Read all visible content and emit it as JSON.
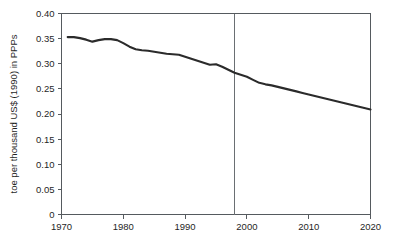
{
  "chart_data": {
    "type": "line",
    "title": "",
    "subtitle": "",
    "xlabel": "",
    "ylabel": "toe per thousand US$ (1990) in PPPs",
    "xlim": [
      1970,
      2020
    ],
    "ylim": [
      0,
      0.4
    ],
    "grid": false,
    "legend": "none",
    "x_ticks": [
      "1970",
      "1980",
      "1990",
      "2000",
      "2010",
      "2020"
    ],
    "x_tick_values": [
      1970,
      1980,
      1990,
      2000,
      2010,
      2020
    ],
    "y_ticks": [
      "0",
      "0.05",
      "0.10",
      "0.15",
      "0.20",
      "0.25",
      "0.30",
      "0.35",
      "0.40"
    ],
    "y_tick_values": [
      0,
      0.05,
      0.1,
      0.15,
      0.2,
      0.25,
      0.3,
      0.35,
      0.4
    ],
    "annotations": [
      {
        "name": "projection-divider",
        "type": "vertical-line",
        "x": 1998,
        "label": ""
      }
    ],
    "series": [
      {
        "name": "energy intensity",
        "x": [
          1971,
          1972,
          1973,
          1974,
          1975,
          1976,
          1977,
          1978,
          1979,
          1980,
          1981,
          1982,
          1983,
          1984,
          1985,
          1986,
          1987,
          1988,
          1989,
          1990,
          1991,
          1992,
          1993,
          1994,
          1995,
          1996,
          1997,
          1998,
          1999,
          2000,
          2001,
          2002,
          2003,
          2004,
          2005,
          2006,
          2007,
          2008,
          2009,
          2010,
          2011,
          2012,
          2013,
          2014,
          2015,
          2016,
          2017,
          2018,
          2019,
          2020
        ],
        "values": [
          0.353,
          0.353,
          0.351,
          0.348,
          0.344,
          0.347,
          0.349,
          0.349,
          0.347,
          0.341,
          0.334,
          0.329,
          0.327,
          0.326,
          0.324,
          0.322,
          0.32,
          0.319,
          0.318,
          0.314,
          0.31,
          0.306,
          0.302,
          0.298,
          0.299,
          0.294,
          0.288,
          0.282,
          0.278,
          0.274,
          0.268,
          0.262,
          0.259,
          0.257,
          0.254,
          0.251,
          0.248,
          0.245,
          0.242,
          0.239,
          0.236,
          0.233,
          0.23,
          0.227,
          0.224,
          0.221,
          0.218,
          0.215,
          0.212,
          0.209
        ]
      }
    ]
  }
}
